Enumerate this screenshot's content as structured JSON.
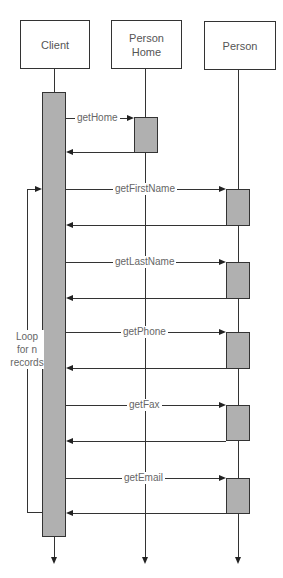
{
  "diagram": {
    "type": "UML sequence diagram",
    "participants": [
      {
        "id": "client",
        "label": "Client"
      },
      {
        "id": "person_home",
        "label": "Person Home",
        "label_lines": [
          "Person",
          "Home"
        ]
      },
      {
        "id": "person",
        "label": "Person"
      }
    ],
    "messages": [
      {
        "label": "getHome",
        "from": "client",
        "to": "person_home",
        "has_return": true
      },
      {
        "label": "getFirstName",
        "from": "client",
        "to": "person",
        "has_return": true
      },
      {
        "label": "getLastName",
        "from": "client",
        "to": "person",
        "has_return": true
      },
      {
        "label": "getPhone",
        "from": "client",
        "to": "person",
        "has_return": true
      },
      {
        "label": "getFax",
        "from": "client",
        "to": "person",
        "has_return": true
      },
      {
        "label": "getEmail",
        "from": "client",
        "to": "person",
        "has_return": true
      }
    ],
    "loop": {
      "label": "Loop for n records",
      "label_lines": [
        "Loop",
        "for n",
        "records"
      ],
      "covers_messages": [
        "getFirstName",
        "getLastName",
        "getPhone",
        "getFax",
        "getEmail"
      ]
    },
    "colors": {
      "activation_fill": "#b0b0b0",
      "line": "#333333",
      "text": "#555555"
    }
  }
}
